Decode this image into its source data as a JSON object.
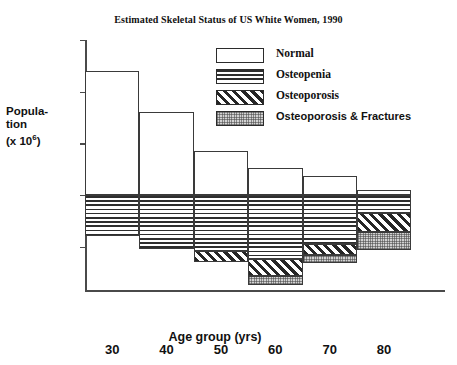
{
  "chart_data": {
    "type": "bar",
    "title": "Estimated Skeletal Status of US White Women, 1990",
    "xlabel": "Age group (yrs)",
    "ylabel_lines": [
      "Popula-",
      "tion",
      "(x  10",
      "6",
      ")"
    ],
    "ylabel_text": "Population (x 10^6)",
    "categories": [
      "30-40",
      "40-50",
      "50-60",
      "60-70",
      "70-80",
      "80+"
    ],
    "x_tick_labels": [
      "30",
      "40",
      "50",
      "60",
      "70",
      "80"
    ],
    "y_tick_labels": [
      "15",
      "10",
      "5",
      "0",
      "5"
    ],
    "y_tick_values": [
      15,
      10,
      5,
      0,
      -5
    ],
    "ylim": [
      -9.2,
      15
    ],
    "grid": false,
    "legend_position": "upper-right",
    "stacking": "diverging-stacked",
    "series": [
      {
        "name": "Normal",
        "pattern": "white",
        "values": [
          12.0,
          8.0,
          4.3,
          2.6,
          1.8,
          0.5
        ]
      },
      {
        "name": "Osteopenia",
        "pattern": "horizontal-lines",
        "values": [
          -4.0,
          -5.2,
          -5.4,
          -6.2,
          -4.7,
          -1.7
        ]
      },
      {
        "name": "Osteoporosis",
        "pattern": "diagonal-hatch",
        "values": [
          0.0,
          0.0,
          -1.1,
          -1.6,
          -1.1,
          -1.9
        ]
      },
      {
        "name": "Osteoporosis & Fractures",
        "pattern": "stipple",
        "values": [
          0.0,
          0.0,
          0.0,
          -0.9,
          -0.8,
          -1.7
        ]
      }
    ],
    "legend_entries": [
      {
        "label": "Normal",
        "pattern": "white"
      },
      {
        "label": "Osteopenia",
        "pattern": "horizontal-lines"
      },
      {
        "label": "Osteoporosis",
        "pattern": "diagonal-hatch"
      },
      {
        "label": "Osteoporosis & Fractures",
        "pattern": "stipple"
      }
    ],
    "colors": {
      "axis": "#4a4a4a",
      "bar_outline": "#3a3a3a",
      "text": "#111111",
      "background": "#ffffff"
    }
  }
}
